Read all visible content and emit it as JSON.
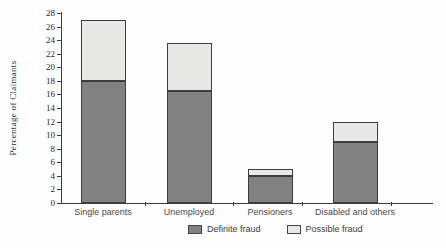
{
  "chart_data": {
    "type": "bar",
    "stacked": true,
    "title": "",
    "xlabel": "",
    "ylabel": "Percentage of Claimants",
    "categories": [
      "Single parents",
      "Unemployed",
      "Pensioners",
      "Disabled and others"
    ],
    "series": [
      {
        "name": "Definite fraud",
        "color": "#818181",
        "values": [
          18,
          16.5,
          4,
          9
        ]
      },
      {
        "name": "Possible fraud",
        "color": "#e8e8e6",
        "values": [
          9,
          7,
          1,
          3
        ]
      }
    ],
    "stack_totals": [
      27,
      23.5,
      5,
      12
    ],
    "ylim": [
      0,
      28
    ],
    "ytick_step": 2,
    "yticks": [
      0,
      2,
      4,
      6,
      8,
      10,
      12,
      14,
      16,
      18,
      20,
      22,
      24,
      26,
      28
    ],
    "grid": false,
    "legend_position": "bottom",
    "colors": {
      "definite_fraud": "#818181",
      "possible_fraud": "#e8e8e6",
      "axis": "#3c3c3c",
      "background": "#fefefe"
    }
  },
  "legend": {
    "items": [
      {
        "label": "Definite fraud",
        "color": "#818181"
      },
      {
        "label": "Possible fraud",
        "color": "#e8e8e6"
      }
    ]
  }
}
